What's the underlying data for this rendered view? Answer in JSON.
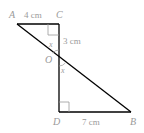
{
  "diagram": {
    "type": "geometry",
    "points": {
      "A": {
        "label": "A",
        "x": 17,
        "y": 24
      },
      "C": {
        "label": "C",
        "x": 59,
        "y": 24
      },
      "O": {
        "label": "O",
        "x": 59,
        "y": 58
      },
      "D": {
        "label": "D",
        "x": 59,
        "y": 112
      },
      "B": {
        "label": "B",
        "x": 131,
        "y": 112
      }
    },
    "measurements": {
      "AC": "4 cm",
      "CO": "3 cm",
      "DB": "7 cm"
    },
    "angles": {
      "upper": "x",
      "lower": "x"
    },
    "colors": {
      "line": "#000000",
      "label": "#9a9a9a"
    }
  }
}
